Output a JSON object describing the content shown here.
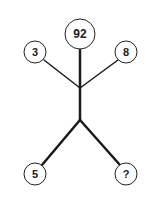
{
  "diagram": {
    "type": "stick-figure number puzzle",
    "nodes": {
      "head": "92",
      "left_hand": "3",
      "right_hand": "8",
      "left_foot": "5",
      "right_foot": "?"
    }
  }
}
